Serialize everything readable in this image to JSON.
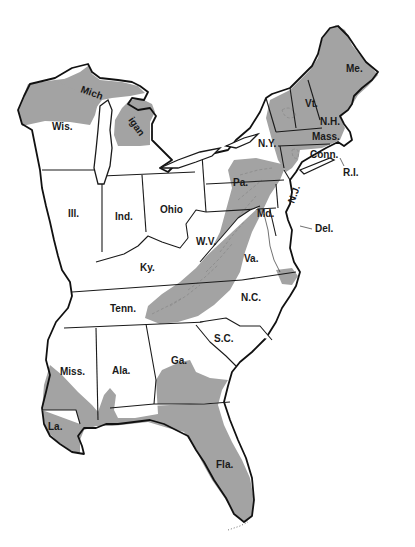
{
  "map": {
    "title": "",
    "shade_color": "#a3a3a3",
    "outline_color": "#1a1a1a",
    "background": "#ffffff",
    "shaded_regions": [
      "Northern Wisconsin",
      "Upper Peninsula of Michigan",
      "Northern Lower Michigan",
      "Maine",
      "Vermont",
      "New Hampshire",
      "Eastern New York (Adirondacks/Catskills)",
      "Massachusetts (western)",
      "Appalachian belt: Pa., Md., W.V., Va., Tenn., N.C., Ga.",
      "Southeastern Virginia coast",
      "Southern Mississippi",
      "Southern Alabama",
      "Louisiana (eastern)",
      "Southern Georgia",
      "Florida"
    ],
    "labels": {
      "wis": "Wis.",
      "mich1": "Mich",
      "mich2": "igan",
      "ill": "Ill.",
      "ind": "Ind.",
      "ohio": "Ohio",
      "ky": "Ky.",
      "tenn": "Tenn.",
      "miss": "Miss.",
      "ala": "Ala.",
      "ga": "Ga.",
      "la": "La.",
      "fla": "Fla.",
      "sc": "S.C.",
      "nc": "N.C.",
      "va": "Va.",
      "wv": "W.V.",
      "md": "Md.",
      "del": "Del.",
      "nj": "N.J.",
      "pa": "Pa.",
      "ny": "N.Y.",
      "vt": "Vt.",
      "nh": "N.H.",
      "me": "Me.",
      "mass": "Mass.",
      "conn": "Conn.",
      "ri": "R.I."
    }
  }
}
